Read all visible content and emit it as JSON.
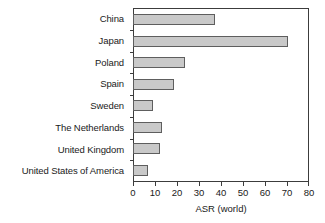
{
  "chart_data": {
    "type": "bar",
    "orientation": "horizontal",
    "title": "",
    "xlabel": "ASR (world)",
    "ylabel": "",
    "xlim": [
      0,
      80
    ],
    "xticks": [
      0,
      10,
      20,
      30,
      40,
      50,
      60,
      70,
      80
    ],
    "grid": false,
    "legend": null,
    "categories": [
      "China",
      "Japan",
      "Poland",
      "Spain",
      "Sweden",
      "The Netherlands",
      "United Kingdom",
      "United States of America"
    ],
    "values": [
      37,
      70,
      23,
      18,
      8.5,
      12.5,
      12,
      6.5
    ],
    "bar_fill_color": "#c9c9c9",
    "bar_edge_color": "#5e5e5e",
    "axis_color": "#3c3c3c",
    "background_color": "#ffffff"
  }
}
